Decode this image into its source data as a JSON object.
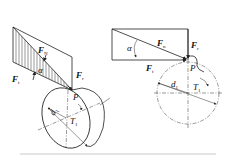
{
  "figure": {
    "left_view": {
      "labels": {
        "Fr": "F",
        "Fr_sub": "r",
        "Ft": "F",
        "Ft_sub": "t",
        "Fn": "F",
        "Fn_sub": "N",
        "angle": "α",
        "point": "P",
        "diameter": "d",
        "diameter_sub": "1",
        "torque": "T",
        "torque_sub": "1"
      }
    },
    "right_view": {
      "labels": {
        "Fn": "F",
        "Fn_sub": "n",
        "Fr": "F",
        "Fr_sub": "r",
        "Ft": "F",
        "Ft_sub": "t",
        "angle": "α",
        "point": "P",
        "diameter": "d",
        "diameter_sub": "1",
        "torque": "T",
        "torque_sub": "1"
      }
    },
    "colors": {
      "line": "#222222",
      "background": "#ffffff"
    }
  }
}
